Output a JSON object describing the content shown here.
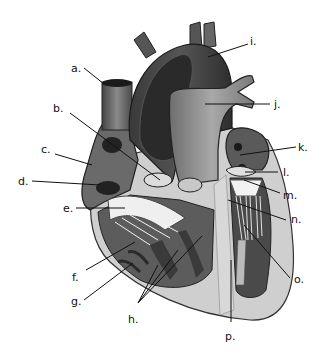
{
  "diagram": {
    "labels": [
      {
        "id": "a",
        "text": "a."
      },
      {
        "id": "b",
        "text": "b."
      },
      {
        "id": "c",
        "text": "c."
      },
      {
        "id": "d",
        "text": "d."
      },
      {
        "id": "e",
        "text": "e."
      },
      {
        "id": "f",
        "text": "f."
      },
      {
        "id": "g",
        "text": "g."
      },
      {
        "id": "h",
        "text": "h."
      },
      {
        "id": "i",
        "text": "i."
      },
      {
        "id": "j",
        "text": "j."
      },
      {
        "id": "k",
        "text": "k."
      },
      {
        "id": "l",
        "text": "l."
      },
      {
        "id": "m",
        "text": "m."
      },
      {
        "id": "n",
        "text": "n."
      },
      {
        "id": "o",
        "text": "o."
      },
      {
        "id": "p",
        "text": "p."
      }
    ]
  }
}
